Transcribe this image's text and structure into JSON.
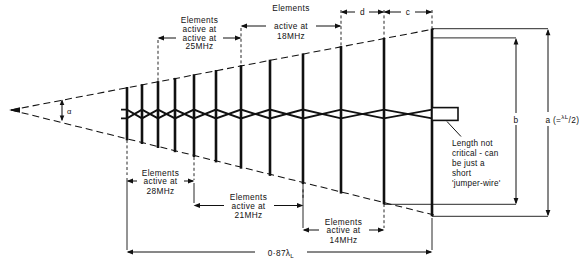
{
  "figure": {
    "apex_angle_label": "α",
    "overall_length_label": "0·87",
    "overall_length_symbol": "λ",
    "overall_length_subscript": "L",
    "longest_element_label": "a",
    "longest_element_formula_open": "(=",
    "longest_element_lambda": "λ",
    "longest_element_lambda_sub": "L",
    "longest_element_div": "/2",
    "longest_element_formula_close": ")",
    "second_element_label": "b",
    "spacing_d_label": "d",
    "spacing_c_label": "c"
  },
  "band_dimensions": {
    "top": [
      {
        "name": "elements-active-25mhz",
        "line1": "Elements",
        "line2": "active at",
        "line3": "25MHz"
      },
      {
        "name": "elements-active-18mhz",
        "line1": "Elements",
        "line2": "active at",
        "line3": "18MHz"
      }
    ],
    "bottom": [
      {
        "name": "elements-active-28mhz",
        "line1": "Elements",
        "line2": "active at",
        "line3": "28MHz"
      },
      {
        "name": "elements-active-21mhz",
        "line1": "Elements",
        "line2": "active at",
        "line3": "21MHz"
      },
      {
        "name": "elements-active-14mhz",
        "line1": "Elements",
        "line2": "active at",
        "line3": "14MHz"
      }
    ]
  },
  "callout": {
    "name": "jumper-wire-note",
    "lines": [
      "Length not",
      "critical - can",
      "be just a",
      "short",
      "'jumper-wire'"
    ]
  },
  "colors": {
    "ink": "#111111",
    "paper": "#ffffff"
  },
  "geometry": {
    "apex_x": 11,
    "apex_y": 110,
    "taper_top_right_x": 432,
    "taper_top_right_y": 30,
    "taper_bottom_right_y": 214,
    "boom_y": 114,
    "elements_x": [
      127,
      142,
      158,
      175,
      194,
      216,
      241,
      270,
      303,
      341,
      384,
      432
    ],
    "element_half_left": 28,
    "element_half_scale": 1.0
  }
}
